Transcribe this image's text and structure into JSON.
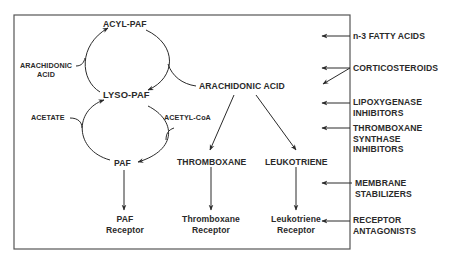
{
  "diagram": {
    "nodes": {
      "acyl_paf": "ACYL-PAF",
      "lyso_paf": "LYSO-PAF",
      "paf": "PAF",
      "arachidonic_acid_small_1": "ARACHIDONIC",
      "arachidonic_acid_small_2": "ACID",
      "acetate": "ACETATE",
      "acetyl_coa": "ACETYL-CoA",
      "arachidonic_acid": "ARACHIDONIC ACID",
      "thromboxane": "THROMBOXANE",
      "leukotriene": "LEUKOTRIENE"
    },
    "receptors": {
      "paf_1": "PAF",
      "paf_2": "Receptor",
      "thromboxane_1": "Thromboxane",
      "thromboxane_2": "Receptor",
      "leukotriene_1": "Leukotriene",
      "leukotriene_2": "Receptor"
    },
    "inhibitors": [
      {
        "lines": [
          "n-3 FATTY ACIDS"
        ]
      },
      {
        "lines": [
          "CORTICOSTEROIDS"
        ]
      },
      {
        "lines": [
          "LIPOXYGENASE",
          "INHIBITORS"
        ]
      },
      {
        "lines": [
          "THROMBOXANE",
          "SYNTHASE",
          "INHIBITORS"
        ]
      },
      {
        "lines": [
          "MEMBRANE",
          "STABILIZERS"
        ]
      },
      {
        "lines": [
          "RECEPTOR",
          "ANTAGONISTS"
        ]
      }
    ],
    "colors": {
      "stroke": "#2a2a2a",
      "box": "#555555",
      "background": "#ffffff"
    }
  }
}
